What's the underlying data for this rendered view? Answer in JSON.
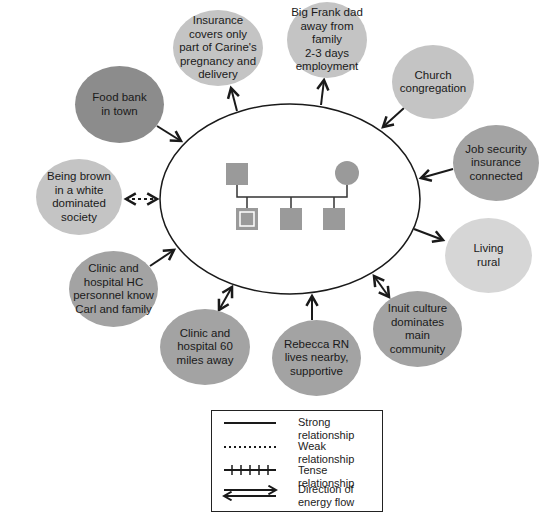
{
  "diagram": {
    "type": "ecomap",
    "center_family": {
      "shape": "ellipse",
      "members": [
        {
          "role": "father",
          "symbol": "square"
        },
        {
          "role": "mother",
          "symbol": "circle"
        },
        {
          "role": "child-identified",
          "symbol": "double-square"
        },
        {
          "role": "child",
          "symbol": "square"
        },
        {
          "role": "child",
          "symbol": "square"
        }
      ]
    },
    "nodes": [
      {
        "id": "insurance",
        "label": "Insurance\ncovers only\npart of Carine's\npregnancy and\ndelivery",
        "shade": "light",
        "relationship": "strong",
        "flow": "outward"
      },
      {
        "id": "big-frank",
        "label": "Big Frank dad\naway from family\n2-3 days\nemployment",
        "shade": "light",
        "relationship": "strong",
        "flow": "outward"
      },
      {
        "id": "church",
        "label": "Church\ncongregation",
        "shade": "light",
        "relationship": "strong",
        "flow": "inward"
      },
      {
        "id": "job-security",
        "label": "Job security\ninsurance\nconnected",
        "shade": "dark",
        "relationship": "strong",
        "flow": "inward"
      },
      {
        "id": "living-rural",
        "label": "Living\nrural",
        "shade": "lighter",
        "relationship": "strong",
        "flow": "outward"
      },
      {
        "id": "inuit-culture",
        "label": "Inuit culture\ndominates main\ncommunity",
        "shade": "dark",
        "relationship": "strong",
        "flow": "both"
      },
      {
        "id": "rebecca",
        "label": "Rebecca RN\nlives nearby,\nsupportive",
        "shade": "dark",
        "relationship": "strong",
        "flow": "inward"
      },
      {
        "id": "clinic-60",
        "label": "Clinic and\nhospital 60\nmiles away",
        "shade": "dark",
        "relationship": "strong",
        "flow": "both"
      },
      {
        "id": "clinic-hc",
        "label": "Clinic and\nhospital HC\npersonnel know\nCarl and family",
        "shade": "dark",
        "relationship": "strong",
        "flow": "inward"
      },
      {
        "id": "being-brown",
        "label": "Being brown\nin a white\ndominated\nsociety",
        "shade": "light",
        "relationship": "weak",
        "flow": "both"
      },
      {
        "id": "food-bank",
        "label": "Food bank\nin town",
        "shade": "darker",
        "relationship": "strong",
        "flow": "inward"
      }
    ],
    "legend": [
      {
        "style": "strong",
        "label": "Strong relationship"
      },
      {
        "style": "weak",
        "label": "Weak relationship"
      },
      {
        "style": "tense",
        "label": "Tense relationship"
      },
      {
        "style": "flow",
        "label": "Direction of\nenergy flow"
      }
    ],
    "colors": {
      "darker": "#8c8c8c",
      "dark": "#a3a3a3",
      "light": "#c4c4c4",
      "lighter": "#d6d6d6",
      "family_symbol": "#9a9a9a",
      "line": "#1a1a1a"
    }
  }
}
